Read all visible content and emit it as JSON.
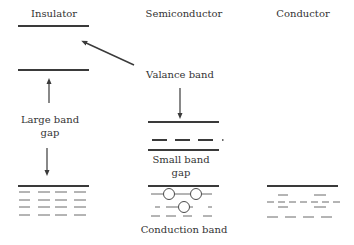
{
  "columns": {
    "insulator": {
      "title": "Insulator"
    },
    "semiconductor": {
      "title": "Semiconductor"
    },
    "conductor": {
      "title": "Conductor"
    }
  },
  "labels": {
    "valance_band": "Valance band",
    "large_band_gap_line1": "Large band",
    "large_band_gap_line2": "gap",
    "small_band_gap_line1": "Small band",
    "small_band_gap_line2": "gap",
    "conduction_band": "Conduction band"
  },
  "colors": {
    "line": "#3a3a3a",
    "dash": "#6a6a6a",
    "text": "#333333",
    "background": "#ffffff"
  }
}
